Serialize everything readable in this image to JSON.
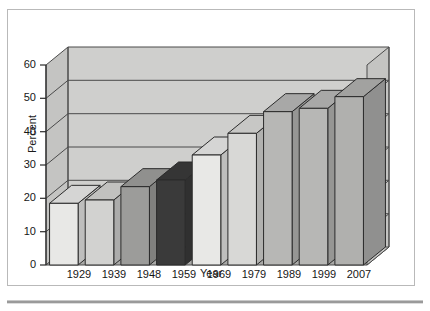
{
  "chart_data": {
    "type": "bar",
    "title": "",
    "xlabel": "Year",
    "ylabel": "Percent",
    "categories": [
      "1929",
      "1939",
      "1948",
      "1959",
      "1969",
      "1979",
      "1989",
      "1999",
      "2007"
    ],
    "values": [
      18.5,
      19.5,
      23.5,
      25.5,
      33,
      39.5,
      46,
      47,
      50.5
    ],
    "ylim": [
      0,
      60
    ],
    "yticks": [
      0,
      10,
      20,
      30,
      40,
      50,
      60
    ],
    "ytick_labels": [
      "0",
      "10",
      "20",
      "30",
      "40",
      "50",
      "60"
    ],
    "grid": true,
    "legend": "none",
    "style": "3d-bar",
    "bar_colors": [
      "#e8e8e6",
      "#d2d2d0",
      "#9c9c9a",
      "#3a3a3a",
      "#e8e8e6",
      "#d8d8d6",
      "#b7b7b5",
      "#b7b7b5",
      "#b0b0ae"
    ]
  },
  "axis": {
    "y_title": "Percent",
    "x_title": "Year"
  },
  "colors": {
    "wall_back": "#cfcfcd",
    "wall_side": "#bdbdbb",
    "floor": "#a9a9a7",
    "outline": "#3d3d3d",
    "frame_border": "#b9b9b9"
  }
}
